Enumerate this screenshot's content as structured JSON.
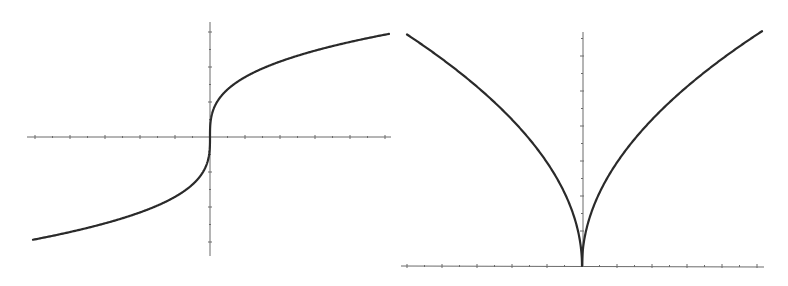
{
  "chart_data": [
    {
      "type": "line",
      "title": "",
      "xlabel": "",
      "ylabel": "",
      "function": "y = x^(1/3)",
      "description": "Cube-root curve with vertical tangent at origin",
      "xlim": [
        -10,
        10
      ],
      "ylim": [
        -6.5,
        6.5
      ],
      "grid": false,
      "legend": null,
      "tick_labels": false,
      "series": [
        {
          "name": "cube-root",
          "x": [
            -10,
            -8,
            -6,
            -4,
            -2,
            -1,
            -0.5,
            -0.1,
            0,
            0.1,
            0.5,
            1,
            2,
            4,
            6,
            8,
            10
          ],
          "y": [
            -2.154,
            -2.0,
            -1.817,
            -1.587,
            -1.26,
            -1.0,
            -0.794,
            -0.464,
            0,
            0.464,
            0.794,
            1.0,
            1.26,
            1.587,
            1.817,
            2.0,
            2.154
          ]
        }
      ],
      "pixel_frame": {
        "origin": [
          210,
          137
        ],
        "x_axis": [
          27,
          391
        ],
        "y_axis": [
          22,
          256
        ],
        "curve_x_range_px": [
          -177,
          179
        ],
        "scale_k": 18.3,
        "tick_spacing_px": 17.5
      },
      "colors": {
        "axis": "#6a6a6a",
        "curve": "#2a2a2a"
      }
    },
    {
      "type": "line",
      "title": "",
      "xlabel": "",
      "ylabel": "",
      "function": "y = sqrt(|x|)",
      "description": "Cusp curve symmetric about y-axis, vertex at origin",
      "xlim": [
        -10,
        10
      ],
      "ylim": [
        0,
        13
      ],
      "grid": false,
      "legend": null,
      "tick_labels": false,
      "series": [
        {
          "name": "sqrt-abs",
          "x": [
            -10,
            -8,
            -6,
            -4,
            -2,
            -1,
            -0.25,
            0,
            0.25,
            1,
            2,
            4,
            6,
            8,
            10
          ],
          "y": [
            3.162,
            2.828,
            2.449,
            2.0,
            1.414,
            1.0,
            0.5,
            0,
            0.5,
            1.0,
            1.414,
            2.0,
            2.449,
            2.828,
            3.162
          ]
        }
      ],
      "pixel_frame": {
        "origin": [
          582,
          266
        ],
        "x_axis": [
          401,
          764
        ],
        "y_axis": [
          32,
          266
        ],
        "curve_x_range_px": [
          -175,
          180
        ],
        "scale_k": 17.5,
        "tick_spacing_px": 17.5
      },
      "colors": {
        "axis": "#6a6a6a",
        "curve": "#2a2a2a"
      }
    }
  ]
}
